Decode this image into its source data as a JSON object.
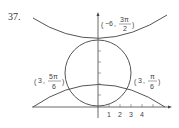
{
  "problem_number": "37.",
  "labels": {
    "top": {
      "r": "−6",
      "theta_num": "3π",
      "theta_den": "2"
    },
    "left": {
      "r": "3",
      "theta_num": "5π",
      "theta_den": "6"
    },
    "right": {
      "r": "3",
      "theta_num": "π",
      "theta_den": "6"
    }
  },
  "x_ticks": [
    "1",
    "2",
    "3",
    "4"
  ],
  "colors": {
    "curve": "#555555",
    "axis": "#444444",
    "text": "#333333"
  }
}
